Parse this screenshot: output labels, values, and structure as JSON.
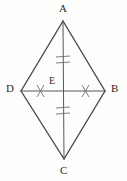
{
  "figure": {
    "background_color": "#fdfdfc",
    "stroke_color": "#4a4a4a",
    "tick_color": "#6e6e6e",
    "label_color": "#2a2a2a",
    "vertices": [
      {
        "name": "A",
        "label": "A",
        "x": 63,
        "y": 21,
        "role": "top-vertex"
      },
      {
        "name": "B",
        "label": "B",
        "x": 105,
        "y": 91,
        "role": "right-vertex"
      },
      {
        "name": "C",
        "label": "C",
        "x": 64,
        "y": 159,
        "role": "bottom-vertex"
      },
      {
        "name": "D",
        "label": "D",
        "x": 21,
        "y": 91,
        "role": "left-vertex"
      },
      {
        "name": "E",
        "label": "E",
        "x": 63,
        "y": 91,
        "role": "diagonal-intersection"
      }
    ],
    "sides": [
      {
        "from": "A",
        "to": "B"
      },
      {
        "from": "B",
        "to": "C"
      },
      {
        "from": "C",
        "to": "D"
      },
      {
        "from": "D",
        "to": "A"
      }
    ],
    "diagonals": [
      {
        "name": "AC",
        "from": "A",
        "to": "C"
      },
      {
        "name": "BD",
        "from": "D",
        "to": "B"
      }
    ],
    "congruence_marks": [
      {
        "segment": "AE",
        "ticks": 2,
        "style": "double-hash"
      },
      {
        "segment": "EC",
        "ticks": 2,
        "style": "double-hash"
      },
      {
        "segment": "DE",
        "ticks": 1,
        "style": "single-slash"
      },
      {
        "segment": "EB",
        "ticks": 1,
        "style": "single-slash"
      }
    ]
  }
}
